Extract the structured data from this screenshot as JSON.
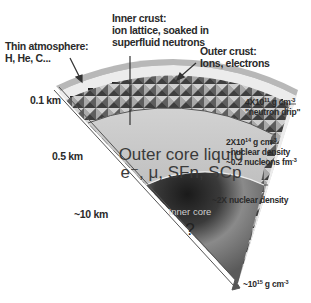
{
  "diagram": {
    "labels": {
      "atmosphere": {
        "line1": "Thin atmosphere:",
        "line2": "H, He, C..."
      },
      "inner_crust": {
        "line1": "Inner crust:",
        "line2": "ion lattice, soaked in",
        "line3": "superfluid neutrons"
      },
      "outer_crust": {
        "line1": "Outer crust:",
        "line2": "Ions, electrons"
      },
      "depth_01": "0.1 km",
      "depth_05": "0.5 km",
      "depth_10": "~10 km",
      "outer_core": {
        "line1": "Outer core liquid",
        "line2": "e⁻, μ, SFn, SCp"
      },
      "inner_core": {
        "title": "Inner core",
        "mark": "?"
      },
      "density_drip": {
        "base": "4X10",
        "exp": "11",
        "unit": " g cm",
        "unit_exp": "-3",
        "note": "\"neutron drip\""
      },
      "density_nuclear": {
        "base": "2X10",
        "exp": "14",
        "unit": " g cm",
        "unit_exp": "-3",
        "note1": "~nuclear density",
        "note2": "~0.2 nucleons fm",
        "note2_exp": "-3"
      },
      "density_2x": "~2X nuclear density",
      "density_center": {
        "base": "~10",
        "exp": "15",
        "unit": " g cm",
        "unit_exp": "-3"
      }
    },
    "colors": {
      "atmosphere": "#b9b9b9",
      "outer_crust": "#e4e4e4",
      "inner_crust": "#7a7a7a",
      "outer_core": "#c4c4c4",
      "inner_core": "#5a5a5a"
    }
  }
}
